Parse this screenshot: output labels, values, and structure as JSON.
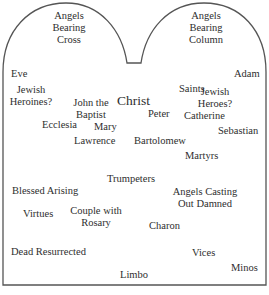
{
  "diagram": {
    "shape": "twin-arched tablet (tympanum layout)",
    "outline_color": "#555555",
    "text_color": "#2e2e2e",
    "labels": [
      {
        "id": "angels-bearing-cross",
        "lines": [
          "Angels",
          "Bearing",
          "Cross"
        ]
      },
      {
        "id": "angels-bearing-column",
        "lines": [
          "Angels",
          "Bearing",
          "Column"
        ]
      },
      {
        "id": "eve",
        "lines": [
          "Eve"
        ]
      },
      {
        "id": "adam",
        "lines": [
          "Adam"
        ]
      },
      {
        "id": "jewish-heroines",
        "lines": [
          "Jewish",
          "Heroines?"
        ]
      },
      {
        "id": "saints",
        "lines": [
          "Saints"
        ]
      },
      {
        "id": "jewish-heroes",
        "lines": [
          "Jewish",
          "Heroes?"
        ]
      },
      {
        "id": "john-the-baptist",
        "lines": [
          "John the",
          "Baptist"
        ]
      },
      {
        "id": "christ",
        "lines": [
          "Christ"
        ]
      },
      {
        "id": "peter",
        "lines": [
          "Peter"
        ]
      },
      {
        "id": "catherine",
        "lines": [
          "Catherine"
        ]
      },
      {
        "id": "ecclesia",
        "lines": [
          "Ecclesia"
        ]
      },
      {
        "id": "mary",
        "lines": [
          "Mary"
        ]
      },
      {
        "id": "sebastian",
        "lines": [
          "Sebastian"
        ]
      },
      {
        "id": "lawrence",
        "lines": [
          "Lawrence"
        ]
      },
      {
        "id": "bartolomew",
        "lines": [
          "Bartolomew"
        ]
      },
      {
        "id": "martyrs",
        "lines": [
          "Martyrs"
        ]
      },
      {
        "id": "trumpeters",
        "lines": [
          "Trumpeters"
        ]
      },
      {
        "id": "blessed-arising",
        "lines": [
          "Blessed Arising"
        ]
      },
      {
        "id": "angels-casting-out-damned",
        "lines": [
          "Angels Casting",
          "Out Damned"
        ]
      },
      {
        "id": "virtues",
        "lines": [
          "Virtues"
        ]
      },
      {
        "id": "couple-with-rosary",
        "lines": [
          "Couple with",
          "Rosary"
        ]
      },
      {
        "id": "charon",
        "lines": [
          "Charon"
        ]
      },
      {
        "id": "dead-resurrected",
        "lines": [
          "Dead Resurrected"
        ]
      },
      {
        "id": "vices",
        "lines": [
          "Vices"
        ]
      },
      {
        "id": "minos",
        "lines": [
          "Minos"
        ]
      },
      {
        "id": "limbo",
        "lines": [
          "Limbo"
        ]
      }
    ]
  }
}
